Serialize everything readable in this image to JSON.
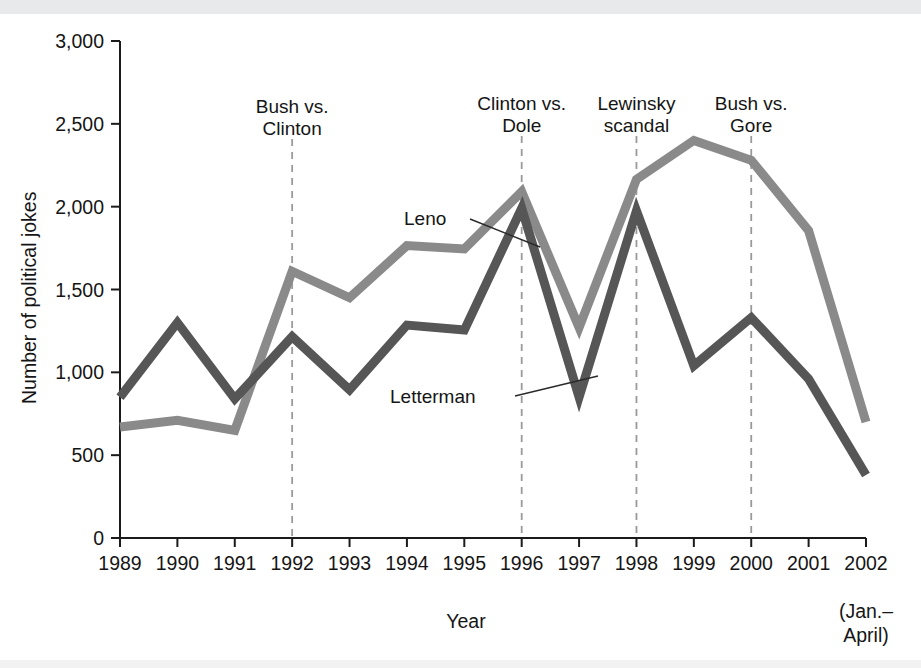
{
  "figure": {
    "background_color": "#ffffff",
    "band_color": "#e8e9ea"
  },
  "axes": {
    "y_title": "Number of political jokes",
    "x_title": "Year",
    "y_ticks": [
      "0",
      "500",
      "1,000",
      "1,500",
      "2,000",
      "2,500",
      "3,000"
    ],
    "x_ticks": [
      "1989",
      "1990",
      "1991",
      "1992",
      "1993",
      "1994",
      "1995",
      "1996",
      "1997",
      "1998",
      "1999",
      "2000",
      "2001",
      "2002"
    ],
    "x_sub_note_line1": "(Jan.–",
    "x_sub_note_line2": "April)"
  },
  "series_labels": {
    "leno": "Leno",
    "letterman": "Letterman"
  },
  "annotations": [
    {
      "id": "bush-vs-clinton",
      "line1": "Bush vs.",
      "line2": "Clinton",
      "year": 1992
    },
    {
      "id": "clinton-vs-dole",
      "line1": "Clinton vs.",
      "line2": "Dole",
      "year": 1996
    },
    {
      "id": "lewinsky-scandal",
      "line1": "Lewinsky",
      "line2": "scandal",
      "year": 1998
    },
    {
      "id": "bush-vs-gore",
      "line1": "Bush vs.",
      "line2": "Gore",
      "year": 2000
    }
  ],
  "chart_data": {
    "type": "line",
    "title": "",
    "xlabel": "Year",
    "ylabel": "Number of political jokes",
    "x": [
      "1989",
      "1990",
      "1991",
      "1992",
      "1993",
      "1994",
      "1995",
      "1996",
      "1997",
      "1998",
      "1999",
      "2000",
      "2001",
      "2002"
    ],
    "ylim": [
      0,
      3000
    ],
    "ytick_step": 500,
    "grid": false,
    "legend": "inline-labels",
    "series": [
      {
        "name": "Leno",
        "color": "#8a8a8a",
        "values": [
          670,
          710,
          650,
          1610,
          1450,
          1765,
          1745,
          2090,
          1270,
          2165,
          2400,
          2280,
          1855,
          700
        ]
      },
      {
        "name": "Letterman",
        "color": "#565656",
        "values": [
          850,
          1300,
          840,
          1215,
          895,
          1285,
          1255,
          1990,
          850,
          1975,
          1040,
          1330,
          960,
          380
        ]
      }
    ],
    "event_markers": [
      {
        "label": "Bush vs. Clinton",
        "year": "1992"
      },
      {
        "label": "Clinton vs. Dole",
        "year": "1996"
      },
      {
        "label": "Lewinsky scandal",
        "year": "1998"
      },
      {
        "label": "Bush vs. Gore",
        "year": "2000"
      }
    ]
  }
}
